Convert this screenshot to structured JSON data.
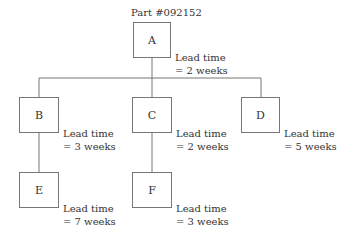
{
  "title": "Part #092152",
  "nodes": [
    {
      "id": "A",
      "label": "A",
      "lead1": "Lead time",
      "lead2": "= 2 weeks"
    },
    {
      "id": "B",
      "label": "B",
      "lead1": "Lead time",
      "lead2": "= 3 weeks"
    },
    {
      "id": "C",
      "label": "C",
      "lead1": "Lead time",
      "lead2": "= 2 weeks"
    },
    {
      "id": "D",
      "label": "D",
      "lead1": "Lead time",
      "lead2": "= 5 weeks"
    },
    {
      "id": "E",
      "label": "E",
      "lead1": "Lead time",
      "lead2": "= 7 weeks"
    },
    {
      "id": "F",
      "label": "F",
      "lead1": "Lead time",
      "lead2": "= 3 weeks"
    }
  ],
  "edges": [
    [
      "A",
      "B"
    ],
    [
      "A",
      "C"
    ],
    [
      "A",
      "D"
    ],
    [
      "B",
      "E"
    ],
    [
      "C",
      "F"
    ]
  ],
  "colors": {
    "line": "#777777",
    "text": "#333333"
  }
}
